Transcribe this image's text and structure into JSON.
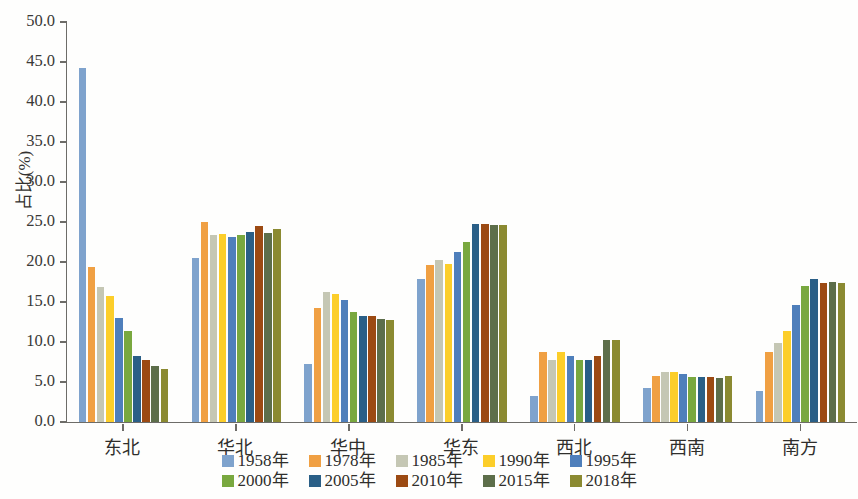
{
  "chart_data": {
    "type": "bar",
    "title": "",
    "subtitle": "",
    "xlabel": "",
    "ylabel": "占比(%)",
    "ylim": [
      0,
      50
    ],
    "ytick_labels": [
      "50.0",
      "45.0",
      "40.0",
      "35.0",
      "30.0",
      "25.0",
      "20.0",
      "15.0",
      "10.0",
      "5.0",
      "0.0"
    ],
    "ytick_values": [
      50,
      45,
      40,
      35,
      30,
      25,
      20,
      15,
      10,
      5,
      0
    ],
    "grid": false,
    "legend_position": "bottom",
    "categories": [
      "东北",
      "华北",
      "华中",
      "华东",
      "西北",
      "西南",
      "南方"
    ],
    "series": [
      {
        "name": "1958年",
        "color": "#7fa3cd",
        "values": [
          44.2,
          20.5,
          7.2,
          17.9,
          3.2,
          4.2,
          3.9
        ]
      },
      {
        "name": "1978年",
        "color": "#f0a043",
        "values": [
          19.4,
          25.0,
          14.2,
          19.6,
          8.7,
          5.8,
          8.8
        ]
      },
      {
        "name": "1985年",
        "color": "#c5c7b4",
        "values": [
          16.9,
          23.4,
          16.3,
          20.2,
          7.8,
          6.2,
          9.9
        ]
      },
      {
        "name": "1990年",
        "color": "#fcce2a",
        "values": [
          15.8,
          23.5,
          16.0,
          19.8,
          8.8,
          6.2,
          11.4
        ]
      },
      {
        "name": "1995年",
        "color": "#4f7fbb",
        "values": [
          13.0,
          23.1,
          15.3,
          21.2,
          8.2,
          6.0,
          14.6
        ]
      },
      {
        "name": "2000年",
        "color": "#79a83f",
        "values": [
          11.4,
          23.4,
          13.7,
          22.5,
          7.8,
          5.6,
          17.0
        ]
      },
      {
        "name": "2005年",
        "color": "#2a5f87",
        "values": [
          8.3,
          23.7,
          13.2,
          24.7,
          7.8,
          5.6,
          17.9
        ]
      },
      {
        "name": "2010年",
        "color": "#9c4a13",
        "values": [
          7.8,
          24.5,
          13.3,
          24.7,
          8.3,
          5.6,
          17.4
        ]
      },
      {
        "name": "2015年",
        "color": "#5d6e4a",
        "values": [
          7.0,
          23.6,
          12.9,
          24.6,
          10.2,
          5.5,
          17.5
        ]
      },
      {
        "name": "2018年",
        "color": "#8b8a31",
        "values": [
          6.6,
          24.1,
          12.7,
          24.6,
          10.3,
          5.7,
          17.4
        ]
      }
    ]
  },
  "legend": {
    "row1": [
      "1958年",
      "1978年",
      "1985年",
      "1990年",
      "1995年"
    ],
    "row2": [
      "2000年",
      "2005年",
      "2010年",
      "2015年",
      "2018年"
    ]
  }
}
